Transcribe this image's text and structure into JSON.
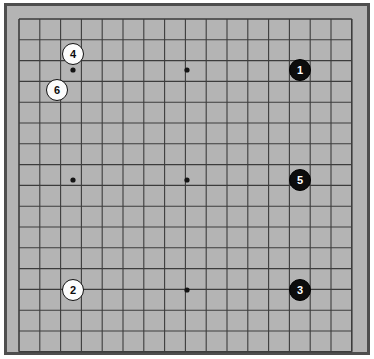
{
  "figure": {
    "kind": "go-board-diagram",
    "board_size_lines": 17,
    "cells": 16,
    "background_color": "#ffffff",
    "board_color": "#b4b4b4",
    "frame_color": "#4e4e4e",
    "line_color": "#3c3c3c",
    "star_point_color": "#141414"
  },
  "grid": {
    "origin_x": 19,
    "origin_y": 19,
    "spacing": 20.8,
    "line_count": 17,
    "star_points": [
      {
        "name": "star-point-top-left",
        "x": 73,
        "y": 70
      },
      {
        "name": "star-point-top-center",
        "x": 187,
        "y": 70
      },
      {
        "name": "star-point-mid-left",
        "x": 73,
        "y": 180
      },
      {
        "name": "star-point-center",
        "x": 187,
        "y": 180
      },
      {
        "name": "star-point-bottom-center",
        "x": 187,
        "y": 290
      }
    ]
  },
  "stones": [
    {
      "move": "1",
      "color": "black",
      "x": 300,
      "y": 70,
      "radius": 11,
      "font_size": 11,
      "text_color": "#ffffff",
      "fill_color": "#0d0d0d"
    },
    {
      "move": "2",
      "color": "white",
      "x": 73,
      "y": 290,
      "radius": 11,
      "font_size": 11,
      "text_color": "#0d0d0d",
      "fill_color": "#fcfcfc"
    },
    {
      "move": "3",
      "color": "black",
      "x": 300,
      "y": 290,
      "radius": 11,
      "font_size": 11,
      "text_color": "#ffffff",
      "fill_color": "#0d0d0d"
    },
    {
      "move": "4",
      "color": "white",
      "x": 73,
      "y": 54,
      "radius": 11,
      "font_size": 11,
      "text_color": "#0d0d0d",
      "fill_color": "#fcfcfc"
    },
    {
      "move": "5",
      "color": "black",
      "x": 300,
      "y": 180,
      "radius": 11,
      "font_size": 11,
      "text_color": "#ffffff",
      "fill_color": "#0d0d0d"
    },
    {
      "move": "6",
      "color": "white",
      "x": 57,
      "y": 90,
      "radius": 11,
      "font_size": 11,
      "text_color": "#0d0d0d",
      "fill_color": "#fcfcfc"
    }
  ]
}
